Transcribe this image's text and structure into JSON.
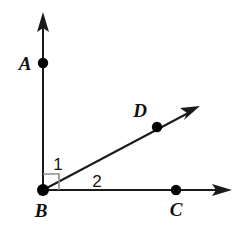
{
  "figure": {
    "type": "geometry-diagram",
    "background_color": "#ffffff",
    "line_color": "#1a1a1a",
    "marker_color": "#8d8d8d",
    "points": [
      {
        "id": "A",
        "label": "A",
        "x": 43,
        "y": 63,
        "label_x": 25,
        "label_y": 70
      },
      {
        "id": "B",
        "label": "B",
        "x": 43,
        "y": 190,
        "label_x": 41,
        "label_y": 217
      },
      {
        "id": "C",
        "label": "C",
        "x": 176,
        "y": 190,
        "label_x": 176,
        "label_y": 216
      },
      {
        "id": "D",
        "label": "D",
        "x": 157,
        "y": 127,
        "label_x": 140,
        "label_y": 117
      }
    ],
    "rays": [
      {
        "id": "BA",
        "from": "B",
        "through": "A",
        "x1": 43,
        "y1": 190,
        "x2": 43,
        "y2": 22
      },
      {
        "id": "BD",
        "from": "B",
        "through": "D",
        "x1": 43,
        "y1": 190,
        "x2": 192,
        "y2": 111
      },
      {
        "id": "BC",
        "from": "B",
        "through": "C",
        "x1": 43,
        "y1": 190,
        "x2": 222,
        "y2": 190
      }
    ],
    "angles": [
      {
        "id": "1",
        "label": "1",
        "between": "BA and BD",
        "label_x": 58,
        "label_y": 170
      },
      {
        "id": "2",
        "label": "2",
        "between": "BD and BC",
        "label_x": 97,
        "label_y": 187
      }
    ],
    "right_angle_marker": {
      "vertex": "B",
      "x": 43,
      "y": 174,
      "size": 16
    }
  }
}
